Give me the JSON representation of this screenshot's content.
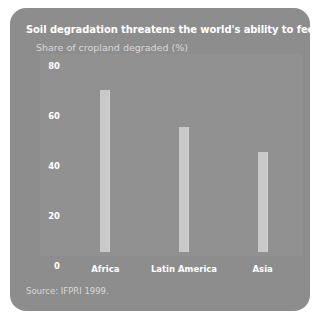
{
  "panel": {
    "background_color": "#8d8d8d",
    "title": "Soil degradation threatens the world's ability to feed itself",
    "subtitle": "Share of cropland degraded (%)",
    "source": "Source: IFPRI 1999."
  },
  "chart_data": {
    "type": "bar",
    "title": "Soil degradation threatens the world's ability to feed itself",
    "subtitle": "Share of cropland degraded (%)",
    "categories": [
      "Africa",
      "Latin America",
      "Asia"
    ],
    "values": [
      65,
      50,
      40
    ],
    "xlabel": "",
    "ylabel": "Share of cropland degraded (%)",
    "ylim": [
      0,
      80
    ],
    "yticks": [
      0,
      20,
      40,
      60,
      80
    ],
    "ytick_labels": [
      "0",
      "20",
      "40",
      "60",
      "80"
    ],
    "grid": false,
    "legend": false,
    "bar_color": "#c9c9c9",
    "source": "Source: IFPRI 1999."
  }
}
